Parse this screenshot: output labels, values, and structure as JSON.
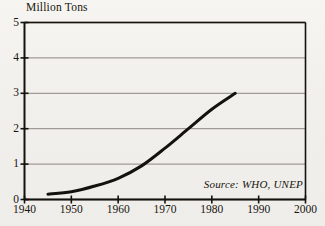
{
  "figure": {
    "y_axis_title": "Million Tons",
    "source_note": "Source: WHO, UNEP"
  },
  "chart_data": {
    "type": "line",
    "title": "",
    "subtitle": "",
    "xlabel": "",
    "ylabel": "Million Tons",
    "xlim": [
      1940,
      2000
    ],
    "ylim": [
      0,
      5
    ],
    "grid": true,
    "legend": "none",
    "annotations": [
      "Source: WHO, UNEP"
    ],
    "xticks": [
      1940,
      1950,
      1960,
      1970,
      1980,
      1990,
      2000
    ],
    "xtick_labels": [
      "1940",
      "1950",
      "1960",
      "1970",
      "1980",
      "1990",
      "2000"
    ],
    "yticks": [
      0,
      1,
      2,
      3,
      4,
      5
    ],
    "ytick_labels": [
      "0",
      "1",
      "2",
      "3",
      "4",
      "5"
    ],
    "series": [
      {
        "name": "Production",
        "x": [
          1945,
          1950,
          1955,
          1960,
          1965,
          1970,
          1975,
          1980,
          1985
        ],
        "values": [
          0.15,
          0.22,
          0.38,
          0.6,
          0.95,
          1.45,
          2.0,
          2.55,
          3.0
        ]
      }
    ],
    "line_color": "#14120d",
    "line_width": 3,
    "grid_color": "#8a8680",
    "frame_color": "#14120d"
  }
}
